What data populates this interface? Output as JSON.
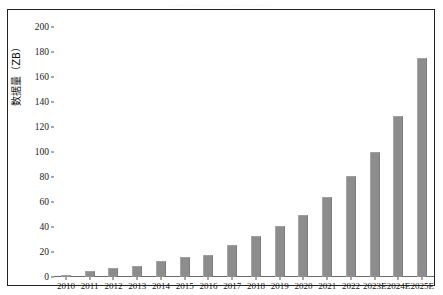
{
  "caption_strip": "................. ....... ........... ..........",
  "chart_data": {
    "type": "bar",
    "title": "",
    "xlabel": "",
    "ylabel": "数据量（ZB）",
    "ylim": [
      0,
      200
    ],
    "ytick_step": 20,
    "yticks": [
      0,
      20,
      40,
      60,
      80,
      100,
      120,
      140,
      160,
      180,
      200
    ],
    "ytick_labels": [
      "0",
      "20",
      "40",
      "60",
      "80",
      "100",
      "120",
      "140",
      "160",
      "180",
      "200"
    ],
    "grid": false,
    "legend": null,
    "bar_color": "#8d8d8d",
    "categories": [
      "2010",
      "2011",
      "2012",
      "2013",
      "2014",
      "2015",
      "2016",
      "2017",
      "2018",
      "2019",
      "2020",
      "2021",
      "2022",
      "2023E",
      "2024E",
      "2025E"
    ],
    "values": [
      2,
      5,
      7,
      9,
      13,
      16,
      18,
      26,
      33,
      41,
      50,
      64,
      81,
      100,
      129,
      175
    ]
  }
}
